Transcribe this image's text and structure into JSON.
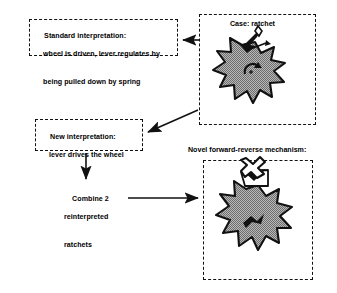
{
  "diagram": {
    "title_caption_novel": "Novel forward-reverse mechanism:",
    "boxes": {
      "standard": {
        "name": "standard-interpretation-box",
        "line1": "Standard interpretation:",
        "line2": "wheel is driven, lever regulates by",
        "line3": "being pulled down by spring"
      },
      "new": {
        "name": "new-interpretation-box",
        "line1": "New interpretation:",
        "line2": "lever drives the wheel"
      },
      "case": {
        "name": "case-ratchet-box",
        "label": "Case: ratchet"
      },
      "novel": {
        "name": "novel-mechanism-box",
        "label": "Novel forward-reverse mechanism:"
      }
    },
    "steps": {
      "combine_line1": "Combine 2",
      "combine_line2": "reinterpreted",
      "combine_line3": "ratchets"
    },
    "icons": {
      "ratchet_wheel": "ratchet-wheel-icon",
      "pawl_lever": "pawl-lever-icon",
      "rotation_arrow": "rotation-arrow-icon",
      "forward_reverse_wheel": "forward-reverse-ratchet-icon",
      "bowtie_pivot": "bowtie-pivot-icon"
    },
    "arrows": {
      "case_to_standard": "arrow-case-to-standard",
      "case_to_new": "arrow-case-to-new",
      "new_to_combine": "arrow-new-to-combine",
      "combine_to_novel": "arrow-combine-to-novel"
    },
    "colors": {
      "stroke": "#111111",
      "wheel_fill": "#9d9d9d",
      "background": "#ffffff"
    }
  }
}
